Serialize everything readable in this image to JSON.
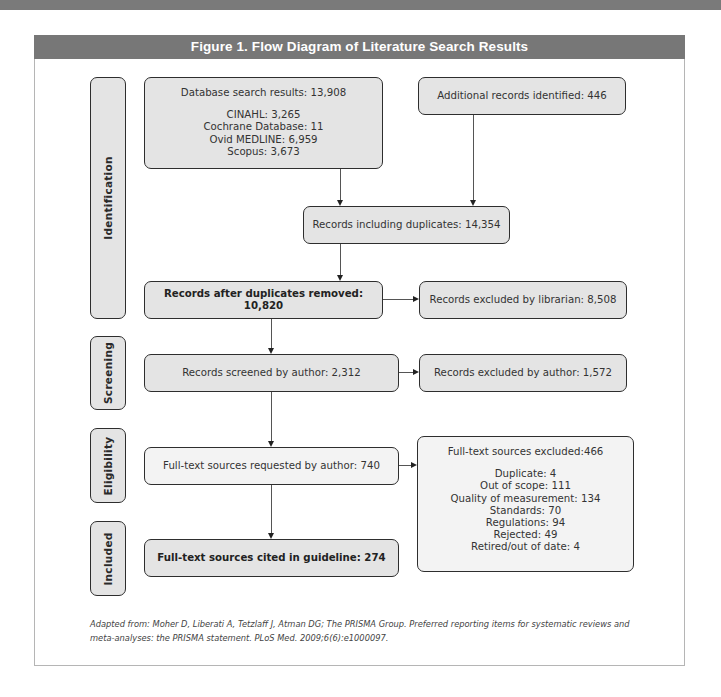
{
  "figure": {
    "title": "Figure 1.  Flow Diagram of Literature Search Results"
  },
  "stages": {
    "identification": "Identification",
    "screening": "Screening",
    "eligibility": "Eligibility",
    "included": "Included"
  },
  "boxes": {
    "database_search": {
      "title": "Database search results: 13,908",
      "items": [
        "CINAHL: 3,265",
        "Cochrane Database: 11",
        "Ovid MEDLINE: 6,959",
        "Scopus: 3,673"
      ]
    },
    "additional_records": "Additional records identified: 446",
    "records_including_duplicates": "Records including duplicates: 14,354",
    "records_after_duplicates": "Records after duplicates removed: 10,820",
    "excluded_by_librarian": "Records excluded by librarian: 8,508",
    "screened_by_author": "Records screened by author: 2,312",
    "excluded_by_author": "Records excluded by author: 1,572",
    "fulltext_requested": "Full-text sources requested by author: 740",
    "fulltext_excluded": {
      "title": "Full-text sources excluded:466",
      "items": [
        "Duplicate: 4",
        "Out of scope: 111",
        "Quality of measurement: 134",
        "Standards: 70",
        "Regulations: 94",
        "Rejected: 49",
        "Retired/out of date: 4"
      ]
    },
    "fulltext_cited": "Full-text sources cited in guideline: 274"
  },
  "footnote": {
    "line1": "Adapted from: Moher D, Liberati A, Tetzlaff J, Atman DG; The PRISMA Group. Preferred reporting items for systematic reviews and",
    "line2": "meta-analyses: the PRISMA statement. PLoS Med. 2009;6(6):e1000097."
  },
  "colors": {
    "header_bg": "#777777",
    "box_fill": "#e4e4e4",
    "box_fill_light": "#f3f3f3",
    "border": "#2e2e2e"
  }
}
